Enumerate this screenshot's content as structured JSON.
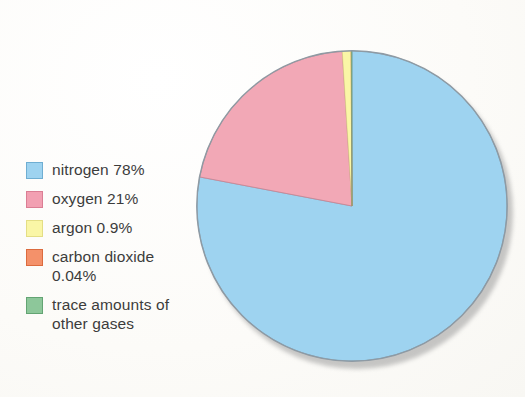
{
  "chart_data": {
    "type": "pie",
    "title": "",
    "subtitle": "",
    "xlabel": "",
    "ylabel": "",
    "legend_position": "left",
    "grid": false,
    "units": "percent",
    "start_angle_deg": 0,
    "direction": "clockwise",
    "categories": [
      "nitrogen",
      "oxygen",
      "argon",
      "carbon dioxide",
      "trace amounts of other gases"
    ],
    "values": [
      78,
      21,
      0.9,
      0.04,
      0.06
    ],
    "value_labels": [
      "78%",
      "21%",
      "0.9%",
      "0.04%",
      ""
    ],
    "colors": [
      "#9ED3F0",
      "#F2A8B6",
      "#FAF6A6",
      "#F4916A",
      "#8DC79A"
    ],
    "slices": [
      {
        "label": "nitrogen",
        "value": 78,
        "display": "nitrogen 78%",
        "color": "#9ED3F0",
        "edge": "#7FA8BF"
      },
      {
        "label": "oxygen",
        "value": 21,
        "display": "oxygen 21%",
        "color": "#F2A8B6",
        "edge": "#C98795"
      },
      {
        "label": "argon",
        "value": 0.9,
        "display": "argon 0.9%",
        "color": "#FAF6A6",
        "edge": "#D6CE7C"
      },
      {
        "label": "carbon dioxide",
        "value": 0.04,
        "display": "carbon dioxide\n0.04%",
        "color": "#F4916A",
        "edge": "#D4704C"
      },
      {
        "label": "trace amounts of other gases",
        "value": 0.06,
        "display": "trace amounts of\nother gases",
        "color": "#8DC79A",
        "edge": "#6AA177"
      }
    ]
  },
  "legend": {
    "items": [
      {
        "label": "nitrogen 78%",
        "swatch_fill": "#9ED3F0",
        "swatch_edge": "#6FAED2",
        "icon": "legend-swatch-nitrogen"
      },
      {
        "label": "oxygen 21%",
        "swatch_fill": "#F2A0B2",
        "swatch_edge": "#DB7E94",
        "icon": "legend-swatch-oxygen"
      },
      {
        "label": "argon 0.9%",
        "swatch_fill": "#FAF6A6",
        "swatch_edge": "#E4DE85",
        "icon": "legend-swatch-argon"
      },
      {
        "label": "carbon dioxide\n0.04%",
        "swatch_fill": "#F4916A",
        "swatch_edge": "#DC6B3E",
        "icon": "legend-swatch-carbon-dioxide"
      },
      {
        "label": "trace amounts of\nother gases",
        "swatch_fill": "#8DC79A",
        "swatch_edge": "#63A473",
        "icon": "legend-swatch-trace-gases"
      }
    ]
  },
  "figure": {
    "background_color": "#fdfdfb",
    "shadow_color": "#9a9a9a",
    "text_color": "#3c3c3c"
  }
}
